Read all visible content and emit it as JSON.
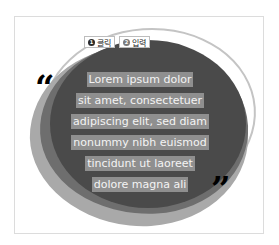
{
  "badges": [
    {
      "number": "1",
      "label": "클릭"
    },
    {
      "number": "2",
      "label": "입력"
    }
  ],
  "quote_marks": {
    "open": "“",
    "close": "”"
  },
  "text_lines": [
    "Lorem ipsum dolor",
    "sit amet, consectetuer",
    "adipiscing elit, sed diam",
    "nonummy nibh euismod",
    "tincidunt ut laoreet",
    "dolore magna ali"
  ],
  "colors": {
    "background": "#ffffff",
    "blob_dark": "#4a4a4a",
    "blob_mid": "#6e6e6e",
    "blob_light": "#a9a9a9",
    "text_highlight": "#8f8f8f",
    "text": "#f4f4f4",
    "quote": "#000000"
  }
}
